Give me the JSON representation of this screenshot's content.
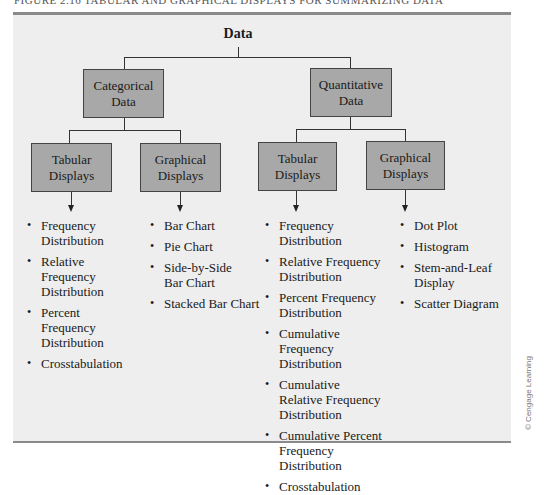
{
  "figure": {
    "caption": "FIGURE 2.16    TABULAR AND GRAPHICAL DISPLAYS FOR SUMMARIZING DATA",
    "credit": "© Cengage Learning"
  },
  "tree": {
    "root": "Data",
    "categorical": {
      "label_line1": "Categorical",
      "label_line2": "Data",
      "tabular": {
        "label_line1": "Tabular",
        "label_line2": "Displays",
        "items": [
          "Frequency Distribution",
          "Relative Frequency Distribution",
          "Percent Frequency Distribution",
          "Crosstabulation"
        ]
      },
      "graphical": {
        "label_line1": "Graphical",
        "label_line2": "Displays",
        "items": [
          "Bar Chart",
          "Pie Chart",
          "Side-by-Side Bar Chart",
          "Stacked Bar Chart"
        ]
      }
    },
    "quantitative": {
      "label_line1": "Quantitative",
      "label_line2": "Data",
      "tabular": {
        "label_line1": "Tabular",
        "label_line2": "Displays",
        "items": [
          "Frequency Distribution",
          "Relative Frequency Distribution",
          "Percent Frequency Distribution",
          "Cumulative Frequency Distribution",
          "Cumulative Relative Frequency Distribution",
          "Cumulative Percent Frequency Distribution",
          "Crosstabulation"
        ]
      },
      "graphical": {
        "label_line1": "Graphical",
        "label_line2": "Displays",
        "items": [
          "Dot Plot",
          "Histogram",
          "Stem-and-Leaf Display",
          "Scatter Diagram"
        ]
      }
    }
  },
  "colors": {
    "panel_bg": "#eeeeee",
    "box_fill": "#a8a8a8",
    "rule": "#8a8a8a"
  }
}
